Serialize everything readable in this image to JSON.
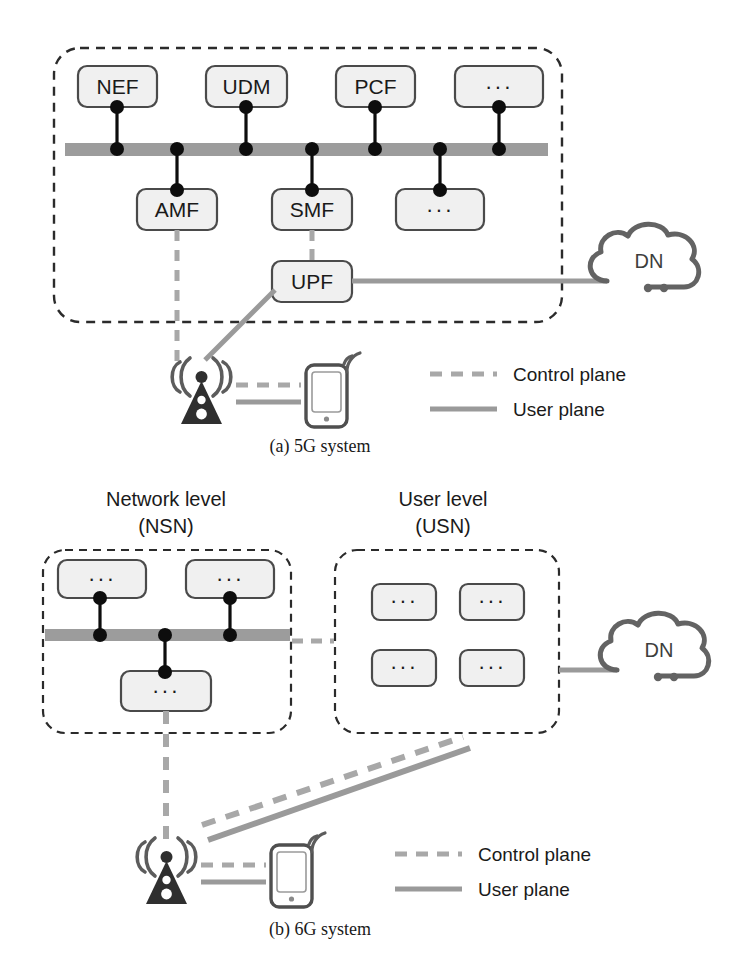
{
  "figure": {
    "panels": [
      {
        "id": "a",
        "caption": "(a)  5G system",
        "headers": [],
        "core_boxes_top": [
          "NEF",
          "UDM",
          "PCF",
          "···"
        ],
        "core_boxes_mid": [
          "AMF",
          "SMF",
          "···"
        ],
        "core_boxes_low": [
          "UPF"
        ],
        "cloud_label": "DN",
        "legend": [
          {
            "style": "dashed",
            "label": "Control plane"
          },
          {
            "style": "solid",
            "label": "User plane"
          }
        ]
      },
      {
        "id": "b",
        "caption": "(b)  6G system",
        "headers": [
          {
            "line1": "Network level",
            "line2": "(NSN)"
          },
          {
            "line1": "User level",
            "line2": "(USN)"
          }
        ],
        "nsn_boxes_top": [
          "···",
          "···"
        ],
        "nsn_boxes_low": [
          "···"
        ],
        "usn_boxes": [
          "···",
          "···",
          "···",
          "···"
        ],
        "cloud_label": "DN",
        "legend": [
          {
            "style": "dashed",
            "label": "Control plane"
          },
          {
            "style": "solid",
            "label": "User plane"
          }
        ]
      }
    ],
    "colors": {
      "box_fill": "#f0f0f0",
      "box_stroke": "#4a4a4a",
      "bus_bar": "#9c9c9c",
      "control_plane": "#a8a8a8",
      "user_plane": "#9a9a9a",
      "boundary": "#2b2b2b",
      "cloud_stroke": "#636363",
      "tower": "#2f2f2f",
      "node_dot": "#0d0d0d"
    }
  }
}
